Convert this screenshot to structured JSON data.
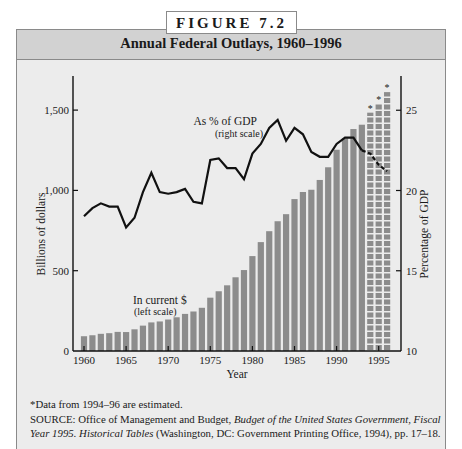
{
  "figure": {
    "label": "FIGURE 7.2",
    "title": "Annual Federal Outlays, 1960–1996"
  },
  "notes": {
    "estimate_note": "*Data from 1994–96 are estimated.",
    "source_label": "SOURCE",
    "source_text_1": ": Office of Management and Budget, ",
    "source_italic_1": "Budget of the United States Government, Fiscal Year 1995. Historical Tables",
    "source_text_2": " (Washington, DC: Government Printing Office, 1994), pp. 17–18."
  },
  "colors": {
    "bar": "#8c8c8c",
    "bar_estimated": "#8c8c8c",
    "line": "#111111",
    "frame_bg": "#ececec",
    "header_bg": "#d2d2d2"
  },
  "chart_data": {
    "type": "bar+line",
    "title": "Annual Federal Outlays, 1960–1996",
    "xlabel": "Year",
    "ylabel": "Billions of dollars",
    "ylabel_right": "Percentage of GDP",
    "x_ticks": [
      "1960",
      "1965",
      "1970",
      "1975",
      "1980",
      "1985",
      "1990",
      "1995"
    ],
    "y_ticks_left": [
      "0",
      "500",
      "1,000",
      "1,500"
    ],
    "y_ticks_right": [
      "10",
      "15",
      "20",
      "25"
    ],
    "ylim_left": [
      0,
      1700
    ],
    "ylim_right": [
      10,
      26.5
    ],
    "grid": false,
    "categories": [
      1960,
      1961,
      1962,
      1963,
      1964,
      1965,
      1966,
      1967,
      1968,
      1969,
      1970,
      1971,
      1972,
      1973,
      1974,
      1975,
      1976,
      1977,
      1978,
      1979,
      1980,
      1981,
      1982,
      1983,
      1984,
      1985,
      1986,
      1987,
      1988,
      1989,
      1990,
      1991,
      1992,
      1993,
      1994,
      1995,
      1996
    ],
    "estimated_years": [
      1994,
      1995,
      1996
    ],
    "series": [
      {
        "name": "In current $ (left scale)",
        "type": "bar",
        "axis": "left",
        "values": [
          92,
          98,
          107,
          111,
          119,
          118,
          135,
          158,
          178,
          184,
          196,
          210,
          231,
          246,
          269,
          332,
          372,
          409,
          459,
          504,
          591,
          678,
          746,
          808,
          852,
          946,
          990,
          1004,
          1065,
          1144,
          1253,
          1324,
          1382,
          1409,
          1484,
          1539,
          1612
        ]
      },
      {
        "name": "As % of GDP (right scale)",
        "type": "line",
        "axis": "right",
        "values": [
          18.4,
          18.9,
          19.2,
          19.0,
          19.0,
          17.7,
          18.3,
          19.9,
          21.1,
          19.9,
          19.8,
          19.9,
          20.1,
          19.3,
          19.2,
          21.9,
          22.0,
          21.4,
          21.4,
          20.7,
          22.3,
          22.9,
          23.9,
          24.4,
          23.1,
          23.9,
          23.5,
          22.4,
          22.1,
          22.1,
          22.9,
          23.3,
          23.3,
          22.5,
          22.3,
          21.6,
          21.2
        ]
      }
    ],
    "annotations": [
      {
        "text": "As % of GDP",
        "sub": "(right scale)"
      },
      {
        "text": "In current $",
        "sub": "(left scale)"
      },
      {
        "text": "*",
        "note": "marks estimated bars 1994–96"
      }
    ]
  }
}
